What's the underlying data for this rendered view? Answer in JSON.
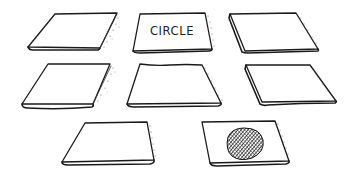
{
  "game": {
    "type": "memory-card-matching",
    "card_count": 8
  },
  "cards": [
    {
      "id": 1,
      "state": "face-down",
      "label": ""
    },
    {
      "id": 2,
      "state": "face-up",
      "label": "CIRCLE"
    },
    {
      "id": 3,
      "state": "face-down",
      "label": ""
    },
    {
      "id": 4,
      "state": "face-down",
      "label": ""
    },
    {
      "id": 5,
      "state": "face-down",
      "label": ""
    },
    {
      "id": 6,
      "state": "face-down",
      "label": ""
    },
    {
      "id": 7,
      "state": "face-down",
      "label": ""
    },
    {
      "id": 8,
      "state": "face-up",
      "label": "",
      "symbol": "hatched-circle"
    }
  ],
  "colors": {
    "ink": "#1a1a1a",
    "card": "#ffffff",
    "background": "#ffffff",
    "hatch": "#222222"
  }
}
